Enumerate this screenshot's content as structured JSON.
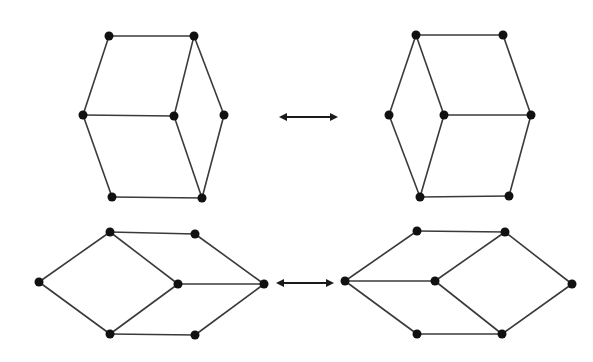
{
  "diagram": {
    "title": "",
    "colors": {
      "edge": "#3a3a3a",
      "node": "#111111",
      "background": "#ffffff"
    },
    "graphs": [
      {
        "id": "top-left",
        "nodes": [
          [
            109,
            36
          ],
          [
            194,
            36
          ],
          [
            83,
            115
          ],
          [
            174,
            116
          ],
          [
            224,
            115
          ],
          [
            112,
            197
          ],
          [
            202,
            198
          ]
        ],
        "edges": [
          [
            0,
            1
          ],
          [
            0,
            2
          ],
          [
            1,
            3
          ],
          [
            1,
            4
          ],
          [
            2,
            3
          ],
          [
            2,
            5
          ],
          [
            3,
            6
          ],
          [
            4,
            6
          ],
          [
            5,
            6
          ]
        ]
      },
      {
        "id": "top-right",
        "nodes": [
          [
            416,
            35
          ],
          [
            503,
            35
          ],
          [
            389,
            115
          ],
          [
            444,
            115
          ],
          [
            531,
            115
          ],
          [
            420,
            197
          ],
          [
            509,
            196
          ]
        ],
        "edges": [
          [
            0,
            1
          ],
          [
            0,
            2
          ],
          [
            0,
            3
          ],
          [
            1,
            4
          ],
          [
            2,
            5
          ],
          [
            3,
            4
          ],
          [
            3,
            5
          ],
          [
            4,
            6
          ],
          [
            5,
            6
          ]
        ]
      },
      {
        "id": "bottom-left",
        "nodes": [
          [
            39,
            282
          ],
          [
            110,
            232
          ],
          [
            195,
            234
          ],
          [
            178,
            284
          ],
          [
            264,
            284
          ],
          [
            110,
            334
          ],
          [
            195,
            335
          ]
        ],
        "edges": [
          [
            0,
            1
          ],
          [
            0,
            5
          ],
          [
            1,
            2
          ],
          [
            1,
            3
          ],
          [
            2,
            4
          ],
          [
            3,
            4
          ],
          [
            3,
            5
          ],
          [
            5,
            6
          ],
          [
            6,
            4
          ]
        ]
      },
      {
        "id": "bottom-right",
        "nodes": [
          [
            345,
            281
          ],
          [
            417,
            231
          ],
          [
            505,
            232
          ],
          [
            435,
            281
          ],
          [
            572,
            284
          ],
          [
            417,
            334
          ],
          [
            502,
            334
          ]
        ],
        "edges": [
          [
            0,
            1
          ],
          [
            0,
            3
          ],
          [
            0,
            5
          ],
          [
            1,
            2
          ],
          [
            2,
            3
          ],
          [
            2,
            4
          ],
          [
            3,
            6
          ],
          [
            5,
            6
          ],
          [
            6,
            4
          ]
        ]
      }
    ],
    "arrows": [
      {
        "id": "top-arrow",
        "x1": 279,
        "x2": 338,
        "y": 117,
        "type": "double"
      },
      {
        "id": "bottom-arrow",
        "x1": 276,
        "x2": 334,
        "y": 283,
        "type": "double"
      }
    ]
  }
}
